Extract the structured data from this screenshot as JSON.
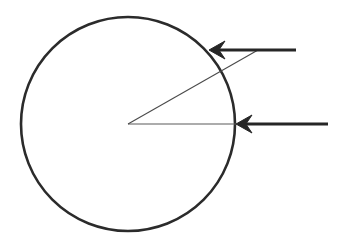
{
  "figure": {
    "canvas": {
      "width": 342,
      "height": 240,
      "background": "#ffffff"
    },
    "colors": {
      "circle_stroke": "#2b2b2b",
      "arrow_stroke": "#262626",
      "radius_stroke": "#5a5a5a",
      "diagonal_stroke": "#4a4a4a",
      "background": "#ffffff"
    },
    "circle": {
      "name": "main-circle",
      "center_x": 128,
      "center_y": 124,
      "radius": 107,
      "stroke_width": 2.6,
      "fill": "none"
    },
    "center_point": {
      "x": 128,
      "y": 124
    },
    "radius_horizontal": {
      "name": "horizontal-radius",
      "x1": 128,
      "y1": 124,
      "x2": 236,
      "y2": 124,
      "stroke_width": 1.1,
      "angle_degrees": 0
    },
    "radius_diagonal": {
      "name": "diagonal-radius",
      "x1": 128,
      "y1": 124,
      "x2": 258,
      "y2": 50,
      "stroke_width": 1.1,
      "angle_degrees": 30
    },
    "arrows": [
      {
        "name": "upper-arrow",
        "tip_x": 209,
        "tip_y": 50,
        "tail_x": 296,
        "tail_y": 50,
        "direction": "left",
        "shaft_width": 3.2,
        "head_length": 16,
        "head_half_width": 9
      },
      {
        "name": "lower-arrow",
        "tip_x": 236,
        "tip_y": 124,
        "tail_x": 328,
        "tail_y": 124,
        "direction": "left",
        "shaft_width": 3.2,
        "head_length": 16,
        "head_half_width": 9
      }
    ]
  }
}
